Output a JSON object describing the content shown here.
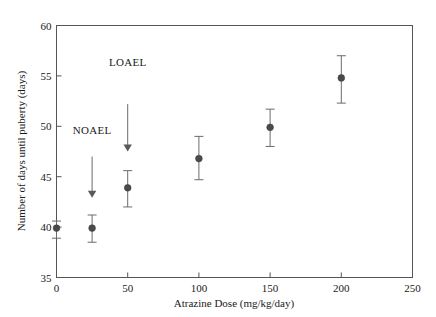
{
  "chart_data": {
    "type": "scatter",
    "title": "",
    "xlabel": "Atrazine Dose (mg/kg/day)",
    "ylabel": "Number of days until puberty (days)",
    "xlim": [
      0,
      250
    ],
    "ylim": [
      35,
      60
    ],
    "grid": false,
    "legend": "none",
    "xticks": [
      "0",
      "50",
      "100",
      "150",
      "200",
      "250"
    ],
    "xtick_values": [
      0,
      50,
      100,
      150,
      200,
      250
    ],
    "yticks": [
      "35",
      "40",
      "45",
      "50",
      "55",
      "60"
    ],
    "ytick_values": [
      35,
      40,
      45,
      50,
      55,
      60
    ],
    "series": [
      {
        "name": "Days until puberty",
        "marker": "filled-circle",
        "error": "error bars",
        "points": [
          {
            "x": 0,
            "y": 39.9,
            "yerr_low": 38.9,
            "yerr_high": 40.6
          },
          {
            "x": 25,
            "y": 39.9,
            "yerr_low": 38.5,
            "yerr_high": 41.2
          },
          {
            "x": 50,
            "y": 43.9,
            "yerr_low": 42.0,
            "yerr_high": 45.6
          },
          {
            "x": 100,
            "y": 46.8,
            "yerr_low": 44.7,
            "yerr_high": 49.0
          },
          {
            "x": 150,
            "y": 49.9,
            "yerr_low": 48.0,
            "yerr_high": 51.7
          },
          {
            "x": 200,
            "y": 54.8,
            "yerr_low": 52.3,
            "yerr_high": 57.0
          }
        ]
      }
    ],
    "annotations": [
      {
        "label": "NOAEL",
        "label_x": 25,
        "label_y": 49.2,
        "arrow_x": 25,
        "arrow_y_start": 47.0,
        "arrow_y_end": 42.9
      },
      {
        "label": "LOAEL",
        "label_x": 50,
        "label_y": 56.0,
        "arrow_x": 50,
        "arrow_y_start": 52.2,
        "arrow_y_end": 47.5
      }
    ]
  },
  "colors": {
    "marker": "#4a4a4a",
    "errorbar": "#6b6b6b",
    "axis": "#555555",
    "text": "#1a1a1a",
    "background": "#ffffff"
  }
}
